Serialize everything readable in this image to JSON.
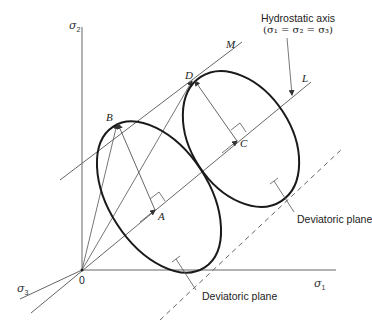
{
  "axes": {
    "sigma1": {
      "symbol": "σ",
      "subscript": "1"
    },
    "sigma2": {
      "symbol": "σ",
      "subscript": "2"
    },
    "sigma3": {
      "symbol": "σ",
      "subscript": "3"
    },
    "origin": "0"
  },
  "hydrostatic_axis": {
    "title": "Hydrostatic axis",
    "equation": "(σ₁ = σ₂ = σ₃)",
    "line_label": "L"
  },
  "points": {
    "A": "A",
    "B": "B",
    "C": "C",
    "D": "D"
  },
  "tangent_line_label": "M",
  "deviatoric_planes": [
    {
      "label": "Deviatoric plane"
    },
    {
      "label": "Deviatoric plane"
    }
  ],
  "colors": {
    "thin_line": "#555555",
    "ellipse": "#1a1a1a",
    "text": "#222222",
    "background": "#ffffff"
  }
}
